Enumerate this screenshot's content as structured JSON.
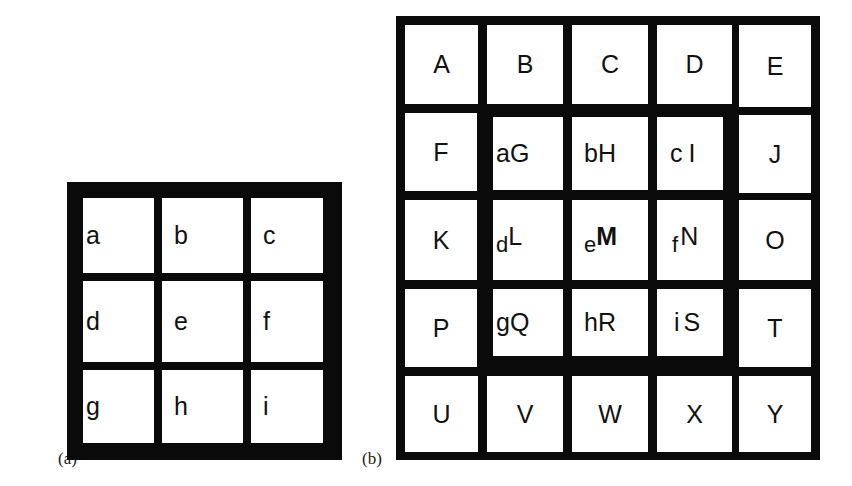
{
  "panels": {
    "a": {
      "label": "(a)",
      "cells": [
        "a",
        "b",
        "c",
        "d",
        "e",
        "f",
        "g",
        "h",
        "i"
      ]
    },
    "b": {
      "label": "(b)",
      "outer_cells": {
        "row0": [
          "A",
          "B",
          "C",
          "D",
          "E"
        ],
        "row1_left": "F",
        "row1_right": "J",
        "row2_left": "K",
        "row2_right": "O",
        "row3_left": "P",
        "row3_right": "T",
        "row4": [
          "U",
          "V",
          "W",
          "X",
          "Y"
        ]
      },
      "inner_cells": [
        {
          "small": "a",
          "big": "G"
        },
        {
          "small": "b",
          "big": "H"
        },
        {
          "small": "c",
          "big": "I"
        },
        {
          "small": "d",
          "big": "L"
        },
        {
          "small": "e",
          "big": "M",
          "bold": true
        },
        {
          "small": "f",
          "big": "N"
        },
        {
          "small": "g",
          "big": "Q"
        },
        {
          "small": "h",
          "big": "R"
        },
        {
          "small": "i",
          "big": "S"
        }
      ]
    }
  },
  "colors": {
    "border": "#0a0a0a",
    "cell": "#ffffff",
    "text": "#111111"
  }
}
